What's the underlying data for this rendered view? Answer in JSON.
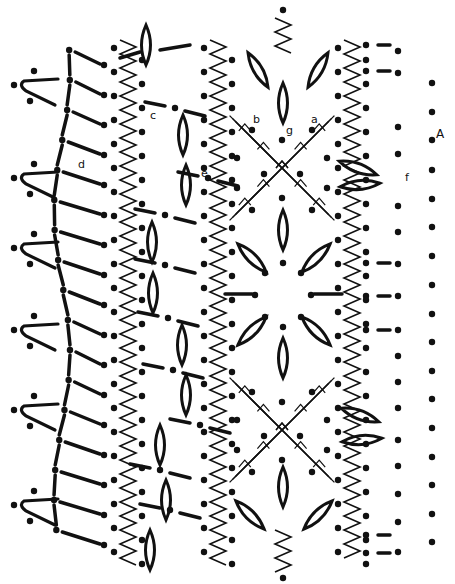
{
  "diagram": {
    "type": "crochet-chart",
    "ink_color": "#111111",
    "background": "#ffffff",
    "labels": [
      {
        "id": "a",
        "text": "a",
        "x": 311,
        "y": 120
      },
      {
        "id": "b",
        "text": "b",
        "x": 253,
        "y": 120
      },
      {
        "id": "c",
        "text": "c",
        "x": 150,
        "y": 116
      },
      {
        "id": "d",
        "text": "d",
        "x": 78,
        "y": 165
      },
      {
        "id": "e",
        "text": "e",
        "x": 201,
        "y": 174
      },
      {
        "id": "f",
        "text": "f",
        "x": 405,
        "y": 178
      },
      {
        "id": "g",
        "text": "g",
        "x": 286,
        "y": 131
      },
      {
        "id": "A",
        "text": "A",
        "x": 436,
        "y": 134
      }
    ],
    "legend_symbols": {
      "dot": "slip-stitch / chain point",
      "dash": "chain",
      "petal": "cluster / puff",
      "zigzag": "chain loop",
      "cross": "crossed double trebles"
    },
    "right_dots_x": 432,
    "right_dots_y": [
      83,
      112,
      140,
      170,
      199,
      227,
      256,
      285,
      314,
      342,
      371,
      399,
      428,
      457,
      485,
      514,
      542
    ],
    "inner_right_dots_x": 398,
    "inner_right_dots_y": [
      51,
      73,
      127,
      154,
      206,
      232,
      264,
      296,
      330,
      356,
      382,
      408,
      440,
      466,
      494,
      522,
      552
    ],
    "petal_centers": [
      {
        "x": 283,
        "y": 103,
        "angle": 90
      },
      {
        "x": 258,
        "y": 70,
        "angle": 60
      },
      {
        "x": 318,
        "y": 70,
        "angle": -60
      },
      {
        "x": 183,
        "y": 135,
        "angle": 90
      },
      {
        "x": 186,
        "y": 185,
        "angle": 90
      },
      {
        "x": 153,
        "y": 293,
        "angle": 90
      },
      {
        "x": 152,
        "y": 242,
        "angle": 90
      },
      {
        "x": 358,
        "y": 168,
        "angle": 20
      },
      {
        "x": 360,
        "y": 185,
        "angle": -5
      },
      {
        "x": 283,
        "y": 230,
        "angle": 90
      },
      {
        "x": 252,
        "y": 258,
        "angle": 45
      },
      {
        "x": 316,
        "y": 258,
        "angle": -45
      },
      {
        "x": 252,
        "y": 331,
        "angle": -45
      },
      {
        "x": 316,
        "y": 331,
        "angle": 45
      },
      {
        "x": 283,
        "y": 358,
        "angle": 90
      },
      {
        "x": 182,
        "y": 345,
        "angle": 90
      },
      {
        "x": 186,
        "y": 395,
        "angle": 90
      },
      {
        "x": 160,
        "y": 445,
        "angle": 90
      },
      {
        "x": 166,
        "y": 500,
        "angle": 90
      },
      {
        "x": 150,
        "y": 550,
        "angle": 90
      },
      {
        "x": 360,
        "y": 415,
        "angle": 20
      },
      {
        "x": 362,
        "y": 440,
        "angle": -5
      },
      {
        "x": 283,
        "y": 487,
        "angle": 90
      },
      {
        "x": 250,
        "y": 515,
        "angle": 45
      },
      {
        "x": 318,
        "y": 515,
        "angle": -45
      },
      {
        "x": 146,
        "y": 45,
        "angle": 90
      }
    ],
    "crosses": [
      {
        "x": 282,
        "y": 168
      },
      {
        "x": 282,
        "y": 430
      }
    ],
    "zigzag_columns": [
      {
        "x": 128,
        "y0": 40,
        "y1": 570
      },
      {
        "x": 218,
        "y0": 40,
        "y1": 570
      },
      {
        "x": 352,
        "y0": 40,
        "y1": 560
      }
    ],
    "left_scallops_y": [
      85,
      178,
      248,
      330,
      410,
      505
    ]
  }
}
